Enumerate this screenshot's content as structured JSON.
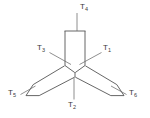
{
  "figure": {
    "type": "technical-line-drawing",
    "background_color": "#ffffff",
    "stroke_color": "#555555",
    "label_color": "#3a3a3a",
    "width": 150,
    "height": 118,
    "labels": [
      {
        "id": "T1",
        "base": "T",
        "sub": "1",
        "x": 103,
        "y": 46
      },
      {
        "id": "T2",
        "base": "T",
        "sub": "2",
        "x": 68,
        "y": 102
      },
      {
        "id": "T3",
        "base": "T",
        "sub": "3",
        "x": 38,
        "y": 46
      },
      {
        "id": "T4",
        "base": "T",
        "sub": "4",
        "x": 79,
        "y": 4
      },
      {
        "id": "T5",
        "base": "T",
        "sub": "5",
        "x": 9,
        "y": 90
      },
      {
        "id": "T6",
        "base": "T",
        "sub": "6",
        "x": 128,
        "y": 90
      }
    ],
    "leader_lines": [
      {
        "id": "leader-T4",
        "from": [
          77,
          14
        ],
        "to": [
          77,
          31
        ]
      },
      {
        "id": "leader-T1",
        "from": [
          102,
          52
        ],
        "to": [
          79,
          64
        ]
      },
      {
        "id": "leader-T3",
        "from": [
          50,
          52
        ],
        "to": [
          71,
          64
        ]
      },
      {
        "id": "leader-T2",
        "from": [
          74,
          99
        ],
        "to": [
          74,
          77
        ]
      },
      {
        "id": "leader-T5",
        "from": [
          20,
          94
        ],
        "to": [
          35,
          86
        ]
      },
      {
        "id": "leader-T6",
        "from": [
          126,
          94
        ],
        "to": [
          111,
          86
        ]
      }
    ],
    "beam_outline": [
      "M 65,31 L 65,66 L 75,73 L 85,66 L 85,31",
      "M 65,66 L 33,85 L 26,96 L 39,96 L 75,77",
      "M 85,66 L 117,85 L 124,96 L 111,96 L 75,77",
      "M 75,73 L 75,77"
    ],
    "top_cap": {
      "from": [
        65,
        31
      ],
      "to": [
        85,
        31
      ]
    }
  }
}
